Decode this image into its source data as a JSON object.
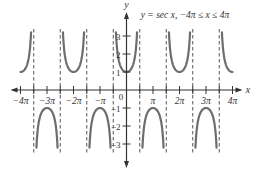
{
  "chart_data": {
    "type": "line",
    "title": "y = sec x, −4π ≤ x ≤ 4π",
    "function": "sec x",
    "xlabel": "x",
    "ylabel": "y",
    "xlim_radians": [
      -12.566,
      12.566
    ],
    "ylim": [
      -3.2,
      3.2
    ],
    "grid": false,
    "legend": null,
    "x_tick_labels": [
      "−4π",
      "−3π",
      "−2π",
      "−π",
      "π",
      "2π",
      "3π",
      "4π"
    ],
    "x_tick_values_pi": [
      -4,
      -3,
      -2,
      -1,
      1,
      2,
      3,
      4
    ],
    "y_tick_labels": [
      "3",
      "2",
      "1",
      "−1",
      "−2",
      "−3"
    ],
    "y_tick_values": [
      3,
      2,
      1,
      -1,
      -2,
      -3
    ],
    "origin_label": "0",
    "asymptotes_pi": [
      -3.5,
      -2.5,
      -1.5,
      -0.5,
      0.5,
      1.5,
      2.5,
      3.5
    ],
    "branch_vertices": [
      {
        "x_pi": -4,
        "y": 1
      },
      {
        "x_pi": -3,
        "y": -1
      },
      {
        "x_pi": -2,
        "y": 1
      },
      {
        "x_pi": -1,
        "y": -1
      },
      {
        "x_pi": 0,
        "y": 1
      },
      {
        "x_pi": 1,
        "y": -1
      },
      {
        "x_pi": 2,
        "y": 1
      },
      {
        "x_pi": 3,
        "y": -1
      },
      {
        "x_pi": 4,
        "y": 1
      }
    ],
    "colors": {
      "curve": "#6e6e6e",
      "axis": "#333333",
      "asymptote": "#555555"
    }
  },
  "labels": {
    "title": "y = sec x, −4π ≤ x ≤ 4π",
    "x_axis": "x",
    "y_axis": "y",
    "origin": "0"
  }
}
